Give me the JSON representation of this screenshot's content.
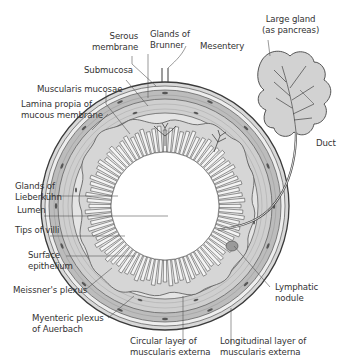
{
  "diagram": {
    "colors": {
      "serosa": "#d9d9d9",
      "muscularis_longitudinal": "#bcbcbc",
      "muscularis_circular": "#cfcfcf",
      "submucosa": "#e4e4e4",
      "mucosa": "#d6d6d6",
      "lumen": "#ffffff",
      "outline": "#3a3a3a",
      "gland": "#cccccc",
      "leader_line": "#555555",
      "text": "#333333"
    },
    "labels": {
      "serous_membrane": {
        "line1": "Serous",
        "line2": "membrane"
      },
      "glands_of_brunner": {
        "line1": "Glands of",
        "line2": "Brunner"
      },
      "mesentery": {
        "line1": "Mesentery"
      },
      "large_gland": {
        "line1": "Large gland",
        "line2": "(as pancreas)"
      },
      "submucosa": {
        "line1": "Submucosa"
      },
      "muscularis_mucosae": {
        "line1": "Muscularis mucosae"
      },
      "lamina_propria": {
        "line1": "Lamina propia of",
        "line2": "mucous membrane"
      },
      "duct": {
        "line1": "Duct"
      },
      "glands_of_lieberkuhn": {
        "line1": "Glands of",
        "line2": "Lieberkühn"
      },
      "lumen": {
        "line1": "Lumen"
      },
      "tips_of_villi": {
        "line1": "Tips of villi"
      },
      "surface_epithelium": {
        "line1": "Surface",
        "line2": "epithelium"
      },
      "lymphatic_nodule": {
        "line1": "Lymphatic",
        "line2": "nodule"
      },
      "meissners_plexus": {
        "line1": "Meissner's plexus"
      },
      "myenteric_plexus": {
        "line1": "Myenteric plexus",
        "line2": "of Auerbach"
      },
      "circular_layer": {
        "line1": "Circular layer of",
        "line2": "muscularis externa"
      },
      "longitudinal_layer": {
        "line1": "Longitudinal layer of",
        "line2": "muscularis externa"
      }
    }
  }
}
